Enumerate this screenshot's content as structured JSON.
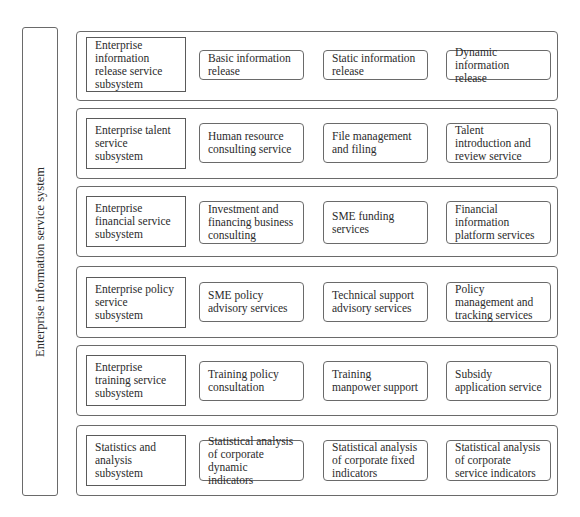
{
  "diagram": {
    "system_label": "Enterprise information service system",
    "rows": [
      {
        "subsystem": "Enterprise information release service subsystem",
        "services": [
          "Basic information release",
          "Static information release",
          "Dynamic information release"
        ]
      },
      {
        "subsystem": "Enterprise talent service subsystem",
        "services": [
          "Human resource consulting service",
          "File management and filing",
          "Talent introduction and review service"
        ]
      },
      {
        "subsystem": "Enterprise financial service subsystem",
        "services": [
          "Investment and financing business consulting",
          "SME funding services",
          "Financial information platform services"
        ]
      },
      {
        "subsystem": "Enterprise policy service subsystem",
        "services": [
          "SME policy advisory services",
          "Technical support advisory services",
          "Policy management and tracking services"
        ]
      },
      {
        "subsystem": "Enterprise training service subsystem",
        "services": [
          "Training policy consultation",
          "Training manpower support",
          "Subsidy application service"
        ]
      },
      {
        "subsystem": "Statistics and analysis subsystem",
        "services": [
          "Statistical analysis of corporate dynamic indicators",
          "Statistical analysis of corporate fixed indicators",
          "Statistical analysis of corporate service indicators"
        ]
      }
    ]
  }
}
